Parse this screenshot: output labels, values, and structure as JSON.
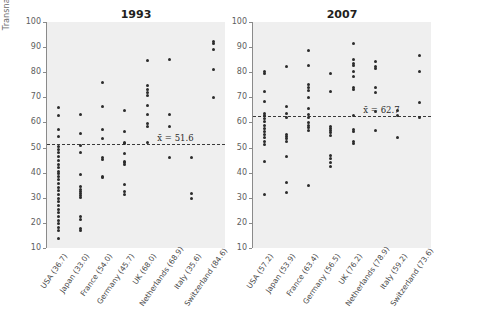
{
  "chart_data": {
    "type": "scatter",
    "title": "",
    "ylabel": "Transnationality index",
    "xlabel": "",
    "ylim": [
      10,
      100
    ],
    "yticks": [
      10,
      20,
      30,
      40,
      50,
      60,
      70,
      80,
      90,
      100
    ],
    "grid": false,
    "legend": "none",
    "panels": [
      {
        "title": "1993",
        "mean_label": "x̄ = 51.6",
        "mean_value": 51.6,
        "categories": [
          "USA (36.7)",
          "Japan (33.0)",
          "France (54.0)",
          "Germany (45.7)",
          "UK (68.0)",
          "Netherlands (68.9)",
          "Italy (35.6)",
          "Switzerland (84.6)"
        ],
        "series": [
          {
            "name": "USA (36.7)",
            "values": [
              66.0,
              62.6,
              57.0,
              54.3,
              50.6,
              49.4,
              47.9,
              46.3,
              44.9,
              43.4,
              42.0,
              40.5,
              39.6,
              38.4,
              37.1,
              35.6,
              34.2,
              32.8,
              31.3,
              29.9,
              28.4,
              26.9,
              25.5,
              24.0,
              22.6,
              21.1,
              19.7,
              18.2,
              16.8,
              13.6
            ]
          },
          {
            "name": "Japan (33.0)",
            "values": [
              63.1,
              55.4,
              51.0,
              48.0,
              39.1,
              34.3,
              33.4,
              32.6,
              31.7,
              30.9,
              30.1,
              22.5,
              21.5,
              17.9,
              17.1
            ]
          },
          {
            "name": "France (54.0)",
            "values": [
              75.8,
              66.3,
              57.2,
              53.5,
              45.9,
              45.3,
              38.4,
              37.9
            ]
          },
          {
            "name": "Germany (45.7)",
            "values": [
              64.7,
              56.3,
              52.0,
              51.5,
              47.8,
              44.5,
              43.9,
              43.3,
              35.2,
              32.5,
              31.5
            ]
          },
          {
            "name": "UK (68.0)",
            "values": [
              84.6,
              74.8,
              73.3,
              72.1,
              70.6,
              66.9,
              63.2,
              59.4,
              58.5,
              51.9
            ]
          },
          {
            "name": "Netherlands (68.9)",
            "values": [
              85.1,
              63.1,
              58.4,
              46.1
            ]
          },
          {
            "name": "Italy (35.6)",
            "values": [
              46.1,
              31.9,
              29.7
            ]
          },
          {
            "name": "Switzerland (84.6)",
            "values": [
              92.4,
              91.6,
              89.2,
              81.2,
              70.0
            ]
          }
        ]
      },
      {
        "title": "2007",
        "mean_label": "x̄ = 62.7",
        "mean_value": 62.7,
        "categories": [
          "USA (57.2)",
          "Japan (53.9)",
          "France (63.4)",
          "Germany (56.5)",
          "UK (76.2)",
          "Netherlands (78.9)",
          "Italy (59.2)",
          "Switzerland (73.6)"
        ],
        "series": [
          {
            "name": "USA (57.2)",
            "values": [
              80.2,
              79.5,
              72.3,
              68.2,
              63.6,
              62.9,
              61.5,
              60.2,
              58.8,
              57.6,
              56.4,
              55.2,
              53.9,
              52.6,
              51.2,
              44.3,
              31.2
            ]
          },
          {
            "name": "Japan (53.9)",
            "values": [
              82.1,
              66.5,
              63.4,
              62.1,
              55.3,
              54.4,
              53.5,
              52.6,
              46.4,
              36.1,
              32.0
            ]
          },
          {
            "name": "France (63.4)",
            "values": [
              88.7,
              82.6,
              75.3,
              74.0,
              72.7,
              70.0,
              65.5,
              63.0,
              61.9,
              60.1,
              58.6,
              57.8,
              56.9,
              34.8
            ]
          },
          {
            "name": "Germany (56.5)",
            "values": [
              79.4,
              72.3,
              58.2,
              57.5,
              56.6,
              55.8,
              55.0,
              46.9,
              45.8,
              43.9,
              42.6
            ]
          },
          {
            "name": "UK (76.2)",
            "values": [
              91.6,
              85.1,
              83.3,
              82.6,
              80.1,
              78.2,
              73.9,
              73.2,
              62.8,
              57.0,
              56.4,
              52.3,
              51.8
            ]
          },
          {
            "name": "Netherlands (78.9)",
            "values": [
              84.4,
              82.3,
              81.6,
              73.9,
              71.8,
              64.3,
              56.6
            ]
          },
          {
            "name": "Italy (59.2)",
            "values": [
              64.6,
              62.6,
              53.9
            ]
          },
          {
            "name": "Switzerland (73.6)",
            "values": [
              86.7,
              80.1,
              67.9,
              62.0
            ]
          }
        ]
      }
    ]
  }
}
